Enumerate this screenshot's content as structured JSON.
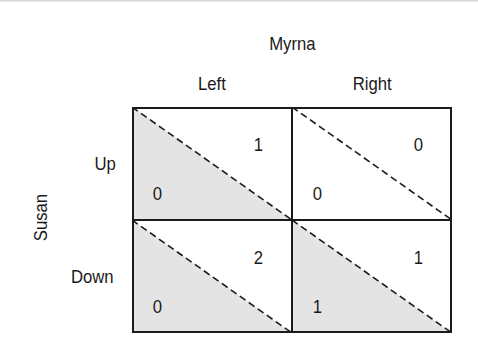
{
  "figure": {
    "type": "payoff-matrix",
    "column_player": "Myrna",
    "row_player": "Susan",
    "column_strategies": [
      "Left",
      "Right"
    ],
    "row_strategies": [
      "Up",
      "Down"
    ],
    "shading_color": "#e4e4e4",
    "line_color": "#1a1a1a",
    "cells": [
      {
        "row": "Up",
        "col": "Left",
        "row_payoff": "0",
        "col_payoff": "1",
        "shaded": true
      },
      {
        "row": "Up",
        "col": "Right",
        "row_payoff": "0",
        "col_payoff": "0",
        "shaded": false
      },
      {
        "row": "Down",
        "col": "Left",
        "row_payoff": "0",
        "col_payoff": "2",
        "shaded": true
      },
      {
        "row": "Down",
        "col": "Right",
        "row_payoff": "1",
        "col_payoff": "1",
        "shaded": true
      }
    ]
  }
}
